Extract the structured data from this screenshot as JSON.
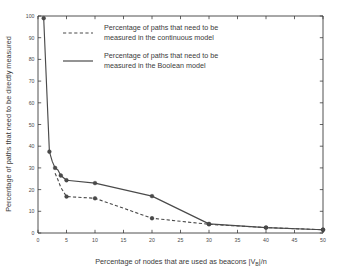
{
  "chart_data": {
    "type": "line",
    "title": "",
    "xlabel": "Percentage of nodes that are used as beacons |V",
    "xlabel_sub": "B",
    "xlabel_tail": "|/n",
    "ylabel": "Percentage of paths that need to be directly measured",
    "xlim": [
      0,
      50
    ],
    "ylim": [
      0,
      100
    ],
    "xticks": [
      0,
      5,
      10,
      15,
      20,
      25,
      30,
      35,
      40,
      45,
      50
    ],
    "xtick_labels": [
      "0",
      "5",
      "10",
      "15",
      "20",
      "25",
      "30",
      "35",
      "40",
      "45",
      "50"
    ],
    "yticks": [
      0,
      10,
      20,
      30,
      40,
      50,
      60,
      70,
      80,
      90,
      100
    ],
    "ytick_labels": [
      "0",
      "10",
      "20",
      "30",
      "40",
      "50",
      "60",
      "70",
      "80",
      "90",
      "100"
    ],
    "grid": false,
    "legend_position": "upper-center",
    "series": [
      {
        "name": "continuous-model",
        "legend_line1": "Percentage of paths that need to be",
        "legend_line2": "measured in the continuous model",
        "style": "dashed",
        "color": "#4a4a4a",
        "x": [
          3,
          3.5,
          4,
          5,
          10,
          20,
          30,
          40,
          50
        ],
        "y": [
          27.5,
          24.5,
          21.0,
          16.8,
          16.0,
          6.8,
          4.0,
          2.5,
          1.5
        ]
      },
      {
        "name": "boolean-model",
        "legend_line1": "Percentage of paths that need to be",
        "legend_line2": "measured in the Boolean model",
        "style": "solid",
        "color": "#4a4a4a",
        "x": [
          1,
          2,
          2.5,
          3,
          3.5,
          4,
          5,
          10,
          20,
          30,
          40,
          50
        ],
        "y": [
          99,
          37.5,
          33.0,
          30.0,
          29.0,
          26.5,
          24.3,
          23.0,
          17.0,
          4.2,
          2.5,
          1.5
        ]
      }
    ],
    "markers": {
      "continuous": [
        [
          5,
          16.8
        ],
        [
          10,
          16.0
        ],
        [
          20,
          6.8
        ],
        [
          30,
          4.0
        ],
        [
          40,
          2.5
        ],
        [
          50,
          1.5
        ]
      ],
      "boolean": [
        [
          1,
          99
        ],
        [
          2,
          37.5
        ],
        [
          3,
          30.0
        ],
        [
          4,
          26.5
        ],
        [
          5,
          24.3
        ],
        [
          10,
          23.0
        ],
        [
          20,
          17.0
        ],
        [
          30,
          4.2
        ],
        [
          40,
          2.5
        ],
        [
          50,
          1.5
        ]
      ]
    }
  }
}
